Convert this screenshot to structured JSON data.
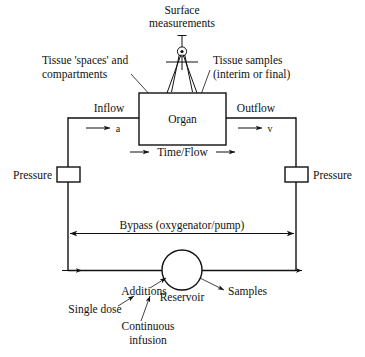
{
  "figure": {
    "background_color": "#ffffff",
    "line_color": "#111111"
  },
  "labels": {
    "surface_measurements_line1": "Surface",
    "surface_measurements_line2": "measurements",
    "tissue_spaces_line1": "Tissue 'spaces' and",
    "tissue_spaces_line2": "compartments",
    "tissue_samples_line1": "Tissue samples",
    "tissue_samples_line2": "(interim or final)",
    "inflow": "Inflow",
    "outflow": "Outflow",
    "organ": "Organ",
    "arterial": "a",
    "venous": "v",
    "time_flow": "Time/Flow",
    "pressure_left": "Pressure",
    "pressure_right": "Pressure",
    "bypass": "Bypass (oxygenator/pump)",
    "reservoir": "Reservoir",
    "additions": "Additions",
    "samples": "Samples",
    "single_dose": "Single dose",
    "continuous_infusion_line1": "Continuous",
    "continuous_infusion_line2": "infusion"
  },
  "icons": {
    "dividers": "dividers-compass-icon",
    "organ_box": "organ-box",
    "pressure_gauge_left": "pressure-gauge-icon",
    "pressure_gauge_right": "pressure-gauge-icon",
    "reservoir_circle": "reservoir-circle-icon"
  }
}
